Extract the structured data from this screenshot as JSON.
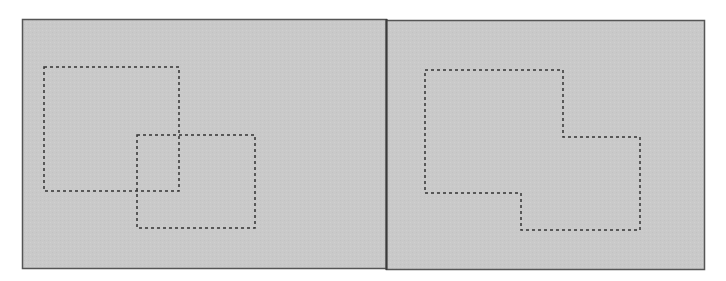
{
  "figure": {
    "colors": {
      "background": "#ffffff",
      "panel_fill": "#c9c9c9",
      "panel_border": "#555555",
      "divider": "#3a3a3a",
      "selection_dash": "#333333"
    },
    "panels": [
      {
        "name": "left-panel",
        "label": "",
        "shapes": [
          {
            "name": "selection-rect-a",
            "points": [
              [
                44,
                67
              ],
              [
                179,
                67
              ],
              [
                179,
                191
              ],
              [
                44,
                191
              ]
            ]
          },
          {
            "name": "selection-rect-b",
            "points": [
              [
                137,
                135
              ],
              [
                255,
                135
              ],
              [
                255,
                228
              ],
              [
                137,
                228
              ]
            ]
          }
        ]
      },
      {
        "name": "right-panel",
        "label": "",
        "shapes": [
          {
            "name": "merged-selection",
            "points": [
              [
                425,
                70
              ],
              [
                563,
                70
              ],
              [
                563,
                137
              ],
              [
                640,
                137
              ],
              [
                640,
                230
              ],
              [
                521,
                230
              ],
              [
                521,
                193
              ],
              [
                425,
                193
              ]
            ]
          }
        ]
      }
    ]
  }
}
